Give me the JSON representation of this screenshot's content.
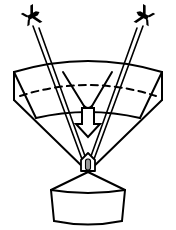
{
  "figure": {
    "background_color": "#ffffff",
    "line_color": "#000000",
    "sensor_core_color": "#9a9a9a",
    "width": 176,
    "height": 230
  },
  "aircraft": [
    {
      "name": "left-aircraft",
      "label": "Aircraft (left)",
      "center_x": 28,
      "center_y": 18,
      "rotation_deg": -28,
      "style": "filled-silhouette"
    },
    {
      "name": "right-aircraft",
      "label": "Aircraft (right)",
      "center_x": 148,
      "center_y": 18,
      "rotation_deg": 28,
      "style": "filled-silhouette"
    }
  ],
  "beams": [
    {
      "name": "left-beam-outer",
      "from_x": 36,
      "from_y": 28,
      "to_x": 86,
      "to_y": 172
    },
    {
      "name": "left-beam-inner",
      "from_x": 40,
      "from_y": 30,
      "to_x": 90,
      "to_y": 172
    },
    {
      "name": "right-beam-outer",
      "from_x": 140,
      "from_y": 28,
      "to_x": 90,
      "to_y": 172
    },
    {
      "name": "right-beam-inner",
      "from_x": 136,
      "from_y": 30,
      "to_x": 86,
      "to_y": 172
    }
  ],
  "coverage_cone": {
    "name": "coverage-volume",
    "top_arc_label": "Upper coverage boundary",
    "bottom_arc_label": "Lower coverage boundary",
    "dashed_ellipse_label": "Hidden horizon ellipse",
    "left_edge_x": 14,
    "right_edge_x": 162,
    "top_y": 57,
    "band_bottom_y": 100,
    "apex_x": 88,
    "apex_y": 172
  },
  "indicator_arrow": {
    "name": "down-arrow",
    "label": "Beam direction arrow",
    "tip_x": 88,
    "tip_y": 133,
    "style": "outlined"
  },
  "sensor": {
    "name": "sensor-head",
    "label": "Sensor head",
    "center_x": 88,
    "center_y": 165
  },
  "base": {
    "name": "antenna-base-cylinder",
    "label": "Antenna base cylinder",
    "left_x": 51,
    "right_x": 125,
    "top_y": 188,
    "bottom_y": 224
  }
}
